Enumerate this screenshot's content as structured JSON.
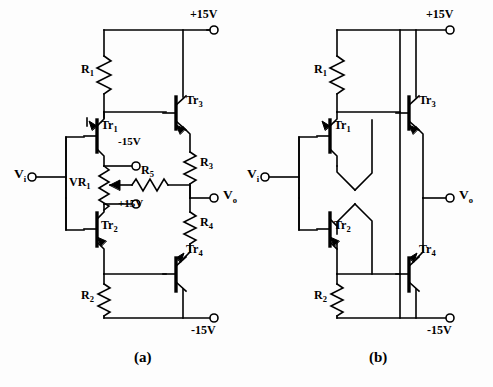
{
  "figure": {
    "background_color": "#fdfdfd",
    "line_color": "#000000",
    "captions": [
      {
        "id": "caption-a",
        "text": "(a)"
      },
      {
        "id": "caption-b",
        "text": "(b)"
      }
    ]
  },
  "circuit_a": {
    "name": "circuit-a",
    "supply_top": "+15V",
    "supply_bottom": "-15V",
    "input_terminal": "V",
    "input_sub": "i",
    "output_terminal": "V",
    "output_sub": "o",
    "components": [
      {
        "id": "r1",
        "label": "R",
        "sub": "1",
        "type": "resistor"
      },
      {
        "id": "r2",
        "label": "R",
        "sub": "2",
        "type": "resistor"
      },
      {
        "id": "r3",
        "label": "R",
        "sub": "3",
        "type": "resistor"
      },
      {
        "id": "r4",
        "label": "R",
        "sub": "4",
        "type": "resistor"
      },
      {
        "id": "r5",
        "label": "R",
        "sub": "5",
        "type": "resistor"
      },
      {
        "id": "vr1",
        "label": "VR",
        "sub": "1",
        "type": "potentiometer"
      },
      {
        "id": "tr1",
        "label": "Tr",
        "sub": "1",
        "type": "transistor-pnp"
      },
      {
        "id": "tr2",
        "label": "Tr",
        "sub": "2",
        "type": "transistor-npn"
      },
      {
        "id": "tr3",
        "label": "Tr",
        "sub": "3",
        "type": "transistor-npn"
      },
      {
        "id": "tr4",
        "label": "Tr",
        "sub": "4",
        "type": "transistor-pnp"
      }
    ],
    "pot_terminals": [
      {
        "id": "vr1-top-terminal",
        "text": "-15V"
      },
      {
        "id": "vr1-bottom-terminal",
        "text": "+15V"
      }
    ]
  },
  "circuit_b": {
    "name": "circuit-b",
    "supply_top": "+15V",
    "supply_bottom": "-15V",
    "input_terminal": "V",
    "input_sub": "i",
    "output_terminal": "V",
    "output_sub": "o",
    "components": [
      {
        "id": "r1",
        "label": "R",
        "sub": "1",
        "type": "resistor"
      },
      {
        "id": "r2",
        "label": "R",
        "sub": "2",
        "type": "resistor"
      },
      {
        "id": "tr1",
        "label": "Tr",
        "sub": "1",
        "type": "transistor-pnp"
      },
      {
        "id": "tr2",
        "label": "Tr",
        "sub": "2",
        "type": "transistor-npn"
      },
      {
        "id": "tr3",
        "label": "Tr",
        "sub": "3",
        "type": "transistor-npn"
      },
      {
        "id": "tr4",
        "label": "Tr",
        "sub": "4",
        "type": "transistor-pnp"
      }
    ]
  }
}
